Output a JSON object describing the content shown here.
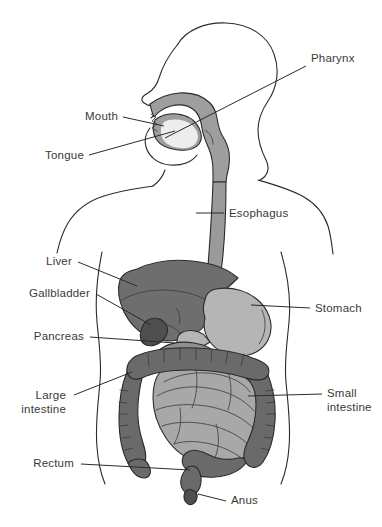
{
  "diagram": {
    "type": "anatomical-illustration",
    "background_color": "#ffffff",
    "line_color": "#2b2b2b",
    "text_color": "#3a3a3a"
  },
  "palette": {
    "body_outline": "#2b2b2b",
    "oral_pharynx": "#9e9e9e",
    "esophagus": "#9a9a9a",
    "stomach": "#b5b5b5",
    "liver": "#6e6e6e",
    "gallbladder": "#4f4f4f",
    "pancreas": "#8f8f8f",
    "small_intestine": "#a8a8a8",
    "large_intestine": "#6a6a6a",
    "rectum": "#6a6a6a",
    "white": "#ffffff"
  },
  "labels": [
    {
      "id": "pharynx",
      "text": "Pharynx",
      "line2": "",
      "x": 311,
      "y": 62,
      "anchor": "start"
    },
    {
      "id": "mouth",
      "text": "Mouth",
      "line2": "",
      "x": 118,
      "y": 120,
      "anchor": "end"
    },
    {
      "id": "tongue",
      "text": "Tongue",
      "line2": "",
      "x": 84,
      "y": 159,
      "anchor": "end"
    },
    {
      "id": "esophagus",
      "text": "Esophagus",
      "line2": "",
      "x": 229,
      "y": 217,
      "anchor": "start"
    },
    {
      "id": "liver",
      "text": "Liver",
      "line2": "",
      "x": 72,
      "y": 265,
      "anchor": "end"
    },
    {
      "id": "gallbladder",
      "text": "Gallbladder",
      "line2": "",
      "x": 90,
      "y": 297,
      "anchor": "end"
    },
    {
      "id": "stomach",
      "text": "Stomach",
      "line2": "",
      "x": 315,
      "y": 312,
      "anchor": "start"
    },
    {
      "id": "pancreas",
      "text": "Pancreas",
      "line2": "",
      "x": 84,
      "y": 340,
      "anchor": "end"
    },
    {
      "id": "large-intestine",
      "text": "Large",
      "line2": "intestine",
      "x": 66,
      "y": 399,
      "anchor": "end"
    },
    {
      "id": "small-intestine",
      "text": "Small",
      "line2": "intestine",
      "x": 327,
      "y": 397,
      "anchor": "start"
    },
    {
      "id": "rectum",
      "text": "Rectum",
      "line2": "",
      "x": 74,
      "y": 467,
      "anchor": "end"
    },
    {
      "id": "anus",
      "text": "Anus",
      "line2": "",
      "x": 231,
      "y": 504,
      "anchor": "start"
    }
  ],
  "leader_lines": [
    {
      "id": "pharynx-leader",
      "d": "M 306 66 L 165 138"
    },
    {
      "id": "mouth-leader",
      "d": "M 123 117 L 164 126"
    },
    {
      "id": "tongue-leader",
      "d": "M 89 155 L 175 131"
    },
    {
      "id": "esophagus-leader",
      "d": "M 224 213 L 196 213"
    },
    {
      "id": "liver-leader",
      "d": "M 78 262 L 137 286"
    },
    {
      "id": "gallbladder-leader",
      "d": "M 96 294 L 151 325"
    },
    {
      "id": "stomach-leader",
      "d": "M 310 308 L 251 305"
    },
    {
      "id": "pancreas-leader",
      "d": "M 90 337 L 175 343"
    },
    {
      "id": "large-intestine-leader",
      "d": "M 74 395 L 132 372"
    },
    {
      "id": "small-intestine-leader",
      "d": "M 322 394 L 248 396"
    },
    {
      "id": "rectum-leader",
      "d": "M 81 464 L 190 470"
    },
    {
      "id": "anus-leader",
      "d": "M 226 501 L 198 494"
    }
  ],
  "organs": [
    {
      "id": "oral-pharynx",
      "name": "Mouth and pharynx cavity",
      "color": "#9e9e9e"
    },
    {
      "id": "esophagus",
      "name": "Esophagus",
      "color": "#9a9a9a"
    },
    {
      "id": "stomach",
      "name": "Stomach",
      "color": "#b5b5b5"
    },
    {
      "id": "liver",
      "name": "Liver",
      "color": "#6e6e6e"
    },
    {
      "id": "gallbladder",
      "name": "Gallbladder",
      "color": "#4f4f4f"
    },
    {
      "id": "pancreas",
      "name": "Pancreas",
      "color": "#8f8f8f"
    },
    {
      "id": "small-intestine",
      "name": "Small intestine",
      "color": "#a8a8a8"
    },
    {
      "id": "large-intestine",
      "name": "Large intestine",
      "color": "#6a6a6a"
    },
    {
      "id": "rectum",
      "name": "Rectum",
      "color": "#6a6a6a"
    },
    {
      "id": "anus",
      "name": "Anus",
      "color": "#6a6a6a"
    }
  ]
}
